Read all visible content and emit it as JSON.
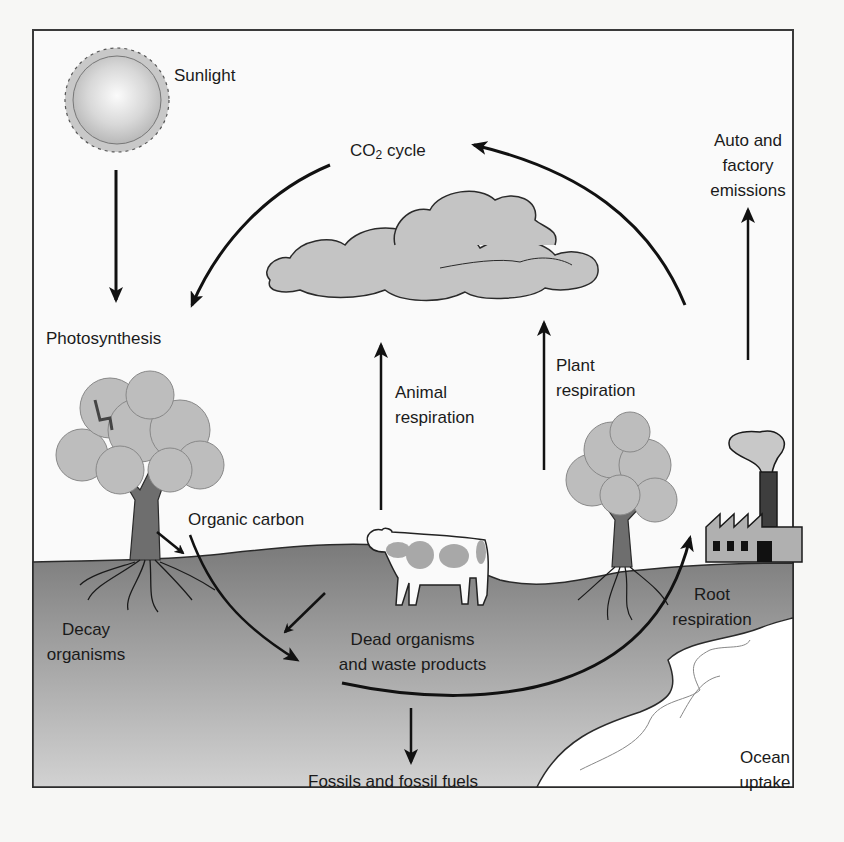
{
  "diagram": {
    "colors": {
      "background": "#f7f7f5",
      "frame": "#3a3a3a",
      "ground_top": "#7d7d7d",
      "ground_bottom": "#cfcfcf",
      "cloud": "#c4c4c4",
      "foliage": "#bdbdbd",
      "trunk": "#6e6e6e",
      "ocean": "#ffffff",
      "arrow": "#111111"
    },
    "labels": {
      "sunlight": "Sunlight",
      "photosynthesis": "Photosynthesis",
      "co2_prefix": "CO",
      "co2_sub": "2",
      "co2_suffix": " cycle",
      "auto_line1": "Auto and",
      "auto_line2": "factory",
      "auto_line3": "emissions",
      "plant_line1": "Plant",
      "plant_line2": "respiration",
      "animal_line1": "Animal",
      "animal_line2": "respiration",
      "organic_carbon": "Organic carbon",
      "decay_line1": "Decay",
      "decay_line2": "organisms",
      "dead_line1": "Dead organisms",
      "dead_line2": "and waste products",
      "root_line1": "Root",
      "root_line2": "respiration",
      "fossils": "Fossils and fossil fuels",
      "ocean_line1": "Ocean",
      "ocean_line2": "uptake"
    },
    "icons": [
      "sun-icon",
      "cloud-icon",
      "tree-icon",
      "cow-icon",
      "factory-icon",
      "ocean-icon"
    ]
  }
}
